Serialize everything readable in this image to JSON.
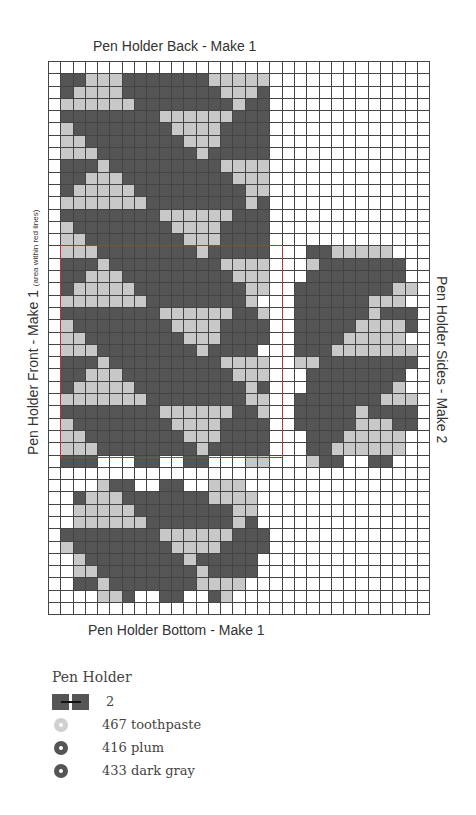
{
  "titles": {
    "back": "Pen Holder Back - Make 1",
    "bottom": "Pen Holder Bottom - Make 1",
    "front": "Pen Holder Front - Make 1",
    "front_note": "(area within red lines)",
    "sides": "Pen Holder Sides - Make 2"
  },
  "grid": {
    "cols": 31,
    "rows": 45,
    "colors": {
      "D": "#555555",
      "L": "#c8c8c8",
      ".": "#ffffff"
    },
    "pattern": [
      "...............................",
      ".DDLLLDDDDDDDLLLLL.............",
      ".DLLLLDDDDDDDDLLLD.............",
      ".LLLLLLDDDDDDDDLDD.............",
      ".DDDDDDDDLLLLLLDDD.............",
      ".LDDDDDDDDLLLLDDDD.............",
      ".LLDDDDDDDDLLLDDDD.............",
      ".LLLDDDDDDDDLDDDDD.............",
      ".DDDLDDDDDDDDDLLLL.............",
      ".DDLLLDDDDDDDDDLLL.............",
      ".DLLLLLDDDDDDDDDLL.............",
      ".LLLLLLLDDDDDDDDLD.............",
      ".DDDDDDDDLLLLLLDDD.............",
      ".LDDDDDDDDLLLLDDDD.............",
      ".LLDDDDDDDDLLLDDDD.............",
      ".LLLDDDDDDDDLDDDDD...DDLLLLL...",
      ".DDDLDDDDDDDDDLLLL...LDDDDDDD..",
      ".DDLLLDDDDDDDDDLLL...DDDDDDDD..",
      ".DLLLLLDDDDDDDDDLL..DDDDDDDDLL.",
      ".LLLLLLLDDDDDDDDL...DDDDDDLLL..",
      ".DDDDDDDDLLLLLLDDL..DDDDDDLDDD.",
      ".LDDDDDDDDLLLLDDDD..DDDDDLLLLD.",
      ".LLDDDDDDDDLLLDDDD..DDDDLLLLL..",
      ".LLLDDDDDDDDLDDDD...DDDLLLLLLL.",
      ".DDDLDDDDDDDDDLLLL..LLDDDDDDDD.",
      ".DDLLLDDDDDDDDDLLL...DDDDDDDD..",
      ".DLLLLLDDDDDDDDDLD...DDDDDDDL..",
      ".LLLLLLLDDDDDDDDLL..DDDDDDDLLL.",
      ".DDDDDDDDLLLLLLDDL..DDDDDLDDDD.",
      ".LDDDDDDDDLLLLDDDD..DDDDDLLLDD.",
      ".LLDDDDDDDDLLLDDDD...DDDLLLLL..",
      ".LLLDDDDDDDDLDDDDD...DDLLLLLL..",
      ".DDD...DD..DD...LL...LDD..DD...",
      "...............................",
      "....LDD..DD..LLL...............",
      "..DLLLDDDDDDDLLLL..............",
      "..LLLLLDDDDDDDDLL..............",
      "..LLLLLLDDDDDDDLD..............",
      ".DDDDDDDDLLLLLLDDD.............",
      ".LDDDDDDDDLLLLDDDD.............",
      "..LDDDDDDDDLDDDDD..............",
      "..LLDDDDDDDDLDDDD..............",
      "..DDLDDDDDDDLLLL...............",
      "....LLD..DD..DL................",
      "..............................."
    ]
  },
  "legend": {
    "title": "Pen Holder",
    "items": [
      {
        "label": "2",
        "type": "stitch",
        "color": "#555555"
      },
      {
        "label": "467 toothpaste",
        "type": "dot",
        "color": "#d0d0d0"
      },
      {
        "label": "416 plum",
        "type": "dot",
        "color": "#555555"
      },
      {
        "label": "433 dark gray",
        "type": "dot",
        "color": "#555555"
      }
    ]
  }
}
